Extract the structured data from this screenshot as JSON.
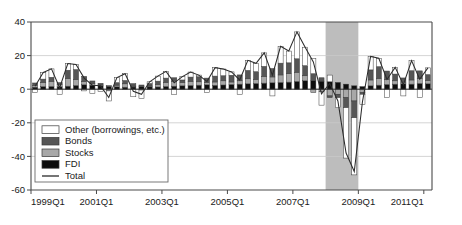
{
  "chart_data": {
    "type": "bar",
    "stacked": true,
    "title": "",
    "subtitle": "",
    "xlabel": "",
    "ylabel": "",
    "ylim": [
      -60,
      40
    ],
    "yticks": [
      40,
      20,
      0,
      -20,
      -40,
      -60
    ],
    "ytick_labels": [
      "40",
      "20",
      "0",
      "-20",
      "-40",
      "-60"
    ],
    "grid": true,
    "grid_axis": "y",
    "legend_position": "lower-left",
    "xtick_labels": [
      "1999Q1",
      "2001Q1",
      "2003Q1",
      "2005Q1",
      "2007Q1",
      "2009Q1",
      "2011Q1"
    ],
    "xtick_index": [
      0,
      8,
      16,
      24,
      32,
      40,
      48
    ],
    "x": [
      "1999Q1",
      "1999Q2",
      "1999Q3",
      "1999Q4",
      "2000Q1",
      "2000Q2",
      "2000Q3",
      "2000Q4",
      "2001Q1",
      "2001Q2",
      "2001Q3",
      "2001Q4",
      "2002Q1",
      "2002Q2",
      "2002Q3",
      "2002Q4",
      "2003Q1",
      "2003Q2",
      "2003Q3",
      "2003Q4",
      "2004Q1",
      "2004Q2",
      "2004Q3",
      "2004Q4",
      "2005Q1",
      "2005Q2",
      "2005Q3",
      "2005Q4",
      "2006Q1",
      "2006Q2",
      "2006Q3",
      "2006Q4",
      "2007Q1",
      "2007Q2",
      "2007Q3",
      "2007Q4",
      "2008Q1",
      "2008Q2",
      "2008Q3",
      "2008Q4",
      "2009Q1",
      "2009Q2",
      "2009Q3",
      "2009Q4",
      "2010Q1",
      "2010Q2",
      "2010Q3",
      "2010Q4",
      "2011Q1"
    ],
    "shaded_regions": [
      {
        "name": "recession",
        "start_index": 36,
        "end_index": 39,
        "color": "#bdbdbd",
        "label": ""
      }
    ],
    "series": [
      {
        "name": "FDI",
        "color": "#0d0d0d",
        "values": [
          1.2,
          1.5,
          1.6,
          1.4,
          1.8,
          2.2,
          2.6,
          2.4,
          2.0,
          1.6,
          1.4,
          1.2,
          1.3,
          1.5,
          1.4,
          1.3,
          1.6,
          1.8,
          2.0,
          2.2,
          2.4,
          2.6,
          2.3,
          2.5,
          2.8,
          3.0,
          3.2,
          3.4,
          3.6,
          3.8,
          4.0,
          4.2,
          4.6,
          5.0,
          5.2,
          4.8,
          4.4,
          4.0,
          3.0,
          2.0,
          1.5,
          2.0,
          2.4,
          2.8,
          3.0,
          3.2,
          3.0,
          3.4,
          3.2
        ]
      },
      {
        "name": "Stocks",
        "color": "#a8a8a8",
        "values": [
          1.0,
          2.5,
          3.0,
          1.5,
          4.5,
          3.5,
          2.0,
          1.0,
          0.5,
          -1.0,
          1.0,
          2.0,
          0.5,
          -0.5,
          0.5,
          1.5,
          2.5,
          3.0,
          2.0,
          2.5,
          2.0,
          1.5,
          2.0,
          2.5,
          1.5,
          2.0,
          3.0,
          2.5,
          4.0,
          3.5,
          4.5,
          5.0,
          5.5,
          3.0,
          -2.0,
          -1.5,
          -4.0,
          -3.0,
          -5.0,
          -7.0,
          -2.0,
          3.5,
          4.0,
          3.0,
          2.0,
          1.0,
          2.5,
          3.0,
          2.0
        ]
      },
      {
        "name": "Bonds",
        "color": "#565656",
        "values": [
          1.5,
          2.0,
          2.5,
          1.0,
          5.0,
          6.0,
          3.0,
          1.5,
          1.0,
          0.5,
          1.5,
          2.0,
          1.5,
          1.0,
          1.5,
          2.0,
          2.5,
          2.0,
          1.5,
          2.5,
          3.0,
          2.5,
          3.5,
          3.0,
          4.0,
          3.5,
          5.0,
          4.5,
          6.0,
          5.0,
          7.0,
          6.5,
          8.0,
          6.0,
          4.0,
          2.0,
          -1.0,
          -2.0,
          -6.0,
          -10.0,
          -1.0,
          6.0,
          7.0,
          5.0,
          4.0,
          2.5,
          5.5,
          4.5,
          3.5
        ]
      },
      {
        "name": "Other (borrowings, etc.)",
        "color": "#ffffff",
        "values": [
          -2.0,
          4.0,
          5.0,
          -3.0,
          4.0,
          3.0,
          -1.0,
          -2.5,
          -1.5,
          -6.0,
          3.0,
          4.0,
          -4.5,
          -5.0,
          1.0,
          3.0,
          4.0,
          -3.0,
          2.0,
          3.0,
          1.0,
          -2.0,
          5.0,
          4.0,
          2.0,
          -3.0,
          6.0,
          5.0,
          8.0,
          -4.0,
          10.0,
          7.0,
          16.0,
          11.0,
          9.0,
          -8.0,
          4.0,
          -6.0,
          -30.0,
          -34.0,
          -6.0,
          8.0,
          5.0,
          -5.0,
          4.0,
          -4.0,
          6.0,
          -5.0,
          4.0
        ]
      }
    ],
    "total_series": {
      "name": "Total",
      "color": "#2b2b2b",
      "values": [
        1.7,
        10.0,
        12.1,
        0.9,
        15.3,
        14.7,
        6.6,
        2.4,
        2.0,
        -4.9,
        6.9,
        9.2,
        -1.2,
        -3.0,
        4.4,
        7.8,
        10.6,
        3.8,
        7.5,
        10.2,
        8.4,
        4.6,
        12.8,
        12.0,
        10.3,
        5.5,
        17.2,
        15.4,
        21.6,
        8.3,
        25.5,
        22.7,
        34.1,
        25.0,
        16.2,
        -2.7,
        3.4,
        -7.0,
        -38.0,
        -49.0,
        -7.5,
        19.5,
        18.4,
        5.8,
        13.0,
        2.7,
        17.0,
        5.9,
        12.7
      ]
    },
    "legend_entries": [
      {
        "label": "Other (borrowings, etc.)",
        "type": "swatch",
        "color": "#ffffff"
      },
      {
        "label": "Bonds",
        "type": "swatch",
        "color": "#565656"
      },
      {
        "label": "Stocks",
        "type": "swatch",
        "color": "#a8a8a8"
      },
      {
        "label": "FDI",
        "type": "swatch",
        "color": "#0d0d0d"
      },
      {
        "label": "Total",
        "type": "line",
        "color": "#2b2b2b"
      }
    ]
  }
}
